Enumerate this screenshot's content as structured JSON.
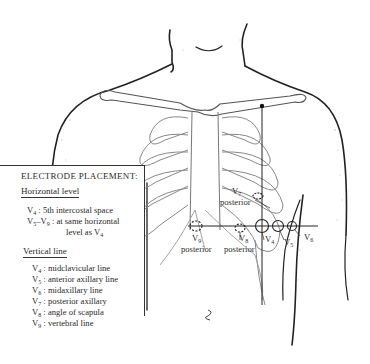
{
  "legend": {
    "title": "ELECTRODE PLACEMENT:",
    "horizontal": {
      "heading": "Horizontal level",
      "lines": [
        {
          "lead": "V",
          "sub": "4",
          "text": " : 5th intercostal space"
        },
        {
          "lead": "V",
          "sub": "5",
          "mid": "–V",
          "sub2": "9",
          "text": " : at same horizontal"
        },
        {
          "text": "level as V",
          "sub": "4"
        }
      ]
    },
    "vertical": {
      "heading": "Vertical line",
      "lines": [
        {
          "lead": "V",
          "sub": "4",
          "text": " : midclavicular line"
        },
        {
          "lead": "V",
          "sub": "5",
          "text": " : anterior axillary line"
        },
        {
          "lead": "V",
          "sub": "6",
          "text": " : midaxillary line"
        },
        {
          "lead": "V",
          "sub": "7",
          "text": " : posterior axillary"
        },
        {
          "lead": "V",
          "sub": "8",
          "text": " : angle of scapula"
        },
        {
          "lead": "V",
          "sub": "9",
          "text": " : vertebral line"
        }
      ]
    }
  },
  "labels": {
    "v7": {
      "lead": "V",
      "sub": "7"
    },
    "v7_posterior": "posterior",
    "v9": {
      "lead": "V",
      "sub": "9"
    },
    "v9_posterior": "posterior",
    "v8": {
      "lead": "V",
      "sub": "8"
    },
    "v8_posterior": "posterior",
    "v4": {
      "lead": "V",
      "sub": "4"
    },
    "v5": {
      "lead": "V",
      "sub": "5"
    },
    "v6": {
      "lead": "V",
      "sub": "6"
    }
  },
  "colors": {
    "ink": "#2a2a2a",
    "bone": "#8a8a8a",
    "background": "#ffffff"
  }
}
